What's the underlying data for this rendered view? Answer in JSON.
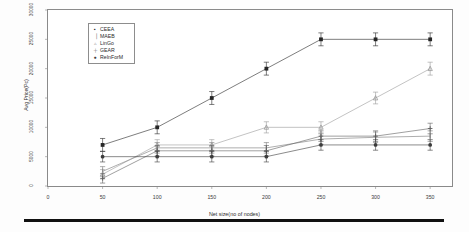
{
  "chart_data": {
    "type": "scatter",
    "title": "",
    "xlabel": "Net size(no of nodes)",
    "ylabel": "Avg Price(Pc)",
    "xlim": [
      0,
      370
    ],
    "ylim": [
      0,
      30000
    ],
    "xticks": [
      0,
      50,
      100,
      150,
      200,
      250,
      300,
      350
    ],
    "xticklabels": [
      "0",
      "50",
      "100",
      "150",
      "200",
      "250",
      "300",
      "350"
    ],
    "yticks": [
      0,
      5000,
      10000,
      15000,
      20000,
      25000,
      30000
    ],
    "yticklabels": [
      "0",
      "5000",
      "10000",
      "15000",
      "20000",
      "25000",
      "30000"
    ],
    "grid": false,
    "legend_position": "upper left",
    "error_bars": true,
    "x": [
      50,
      100,
      150,
      200,
      250,
      300,
      350
    ],
    "series": [
      {
        "name": "CEEA",
        "marker": "square",
        "color": "#262626",
        "values": [
          7000,
          10000,
          15000,
          20000,
          25000,
          25000,
          25000
        ],
        "errors": [
          1100,
          1100,
          1100,
          1100,
          1100,
          1100,
          1100
        ]
      },
      {
        "name": "MAEB",
        "marker": "tick",
        "color": "#777777",
        "values": [
          2500,
          6500,
          6500,
          6500,
          8000,
          8300,
          8500
        ],
        "errors": [
          800,
          900,
          900,
          900,
          900,
          900,
          900
        ]
      },
      {
        "name": "LinGo",
        "marker": "triangle",
        "color": "#9a9a9a",
        "values": [
          2000,
          7000,
          7000,
          10000,
          10000,
          15000,
          20000
        ],
        "errors": [
          800,
          900,
          900,
          950,
          950,
          1000,
          1100
        ]
      },
      {
        "name": "GEAR",
        "marker": "plus",
        "color": "#5f5f5f",
        "values": [
          1300,
          6000,
          6000,
          6000,
          8500,
          8500,
          9800
        ],
        "errors": [
          800,
          900,
          900,
          900,
          900,
          900,
          900
        ]
      },
      {
        "name": "ReInForM",
        "marker": "circle",
        "color": "#3c3c3c",
        "values": [
          5000,
          5000,
          5000,
          5000,
          7000,
          7000,
          7000
        ],
        "errors": [
          900,
          900,
          900,
          900,
          900,
          900,
          900
        ]
      }
    ]
  },
  "legend": {
    "entries": [
      {
        "symbol": "▪",
        "label": "CEEA"
      },
      {
        "symbol": "▕",
        "label": "MAEB"
      },
      {
        "symbol": "▵",
        "label": "LinGo"
      },
      {
        "symbol": "＋",
        "label": "GEAR"
      },
      {
        "symbol": "●",
        "label": "ReInForM"
      }
    ]
  }
}
